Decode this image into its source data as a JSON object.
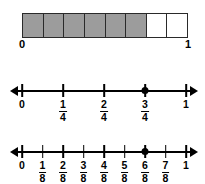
{
  "figure": {
    "bar_model": {
      "name": "fraction-bar-eighths",
      "total_cells": 8,
      "shaded_cells": 6,
      "shade_color": "#9c9c9c",
      "unshaded_color": "#ffffff",
      "border_color": "#2a2a2a",
      "cells": [
        {
          "index": 1,
          "state": "shaded"
        },
        {
          "index": 2,
          "state": "shaded"
        },
        {
          "index": 3,
          "state": "shaded"
        },
        {
          "index": 4,
          "state": "shaded"
        },
        {
          "index": 5,
          "state": "shaded"
        },
        {
          "index": 6,
          "state": "shaded"
        },
        {
          "index": 7,
          "state": "unshaded"
        },
        {
          "index": 8,
          "state": "unshaded"
        }
      ],
      "start_label": "0",
      "end_label": "1"
    },
    "number_lines": [
      {
        "name": "number-line-fourths",
        "denominator": 4,
        "axis_min": 0,
        "axis_max": 1,
        "arrows": [
          "left",
          "right"
        ],
        "marked_point": {
          "label_numerator": "3",
          "label_denominator": "4",
          "position": 0.75
        },
        "ticks": [
          {
            "position": 0,
            "type": "whole",
            "whole": "0"
          },
          {
            "position": 0.25,
            "type": "fraction",
            "numerator": "1",
            "denominator": "4"
          },
          {
            "position": 0.5,
            "type": "fraction",
            "numerator": "2",
            "denominator": "4"
          },
          {
            "position": 0.75,
            "type": "fraction",
            "numerator": "3",
            "denominator": "4"
          },
          {
            "position": 1,
            "type": "whole",
            "whole": "1"
          }
        ]
      },
      {
        "name": "number-line-eighths",
        "denominator": 8,
        "axis_min": 0,
        "axis_max": 1,
        "arrows": [
          "left",
          "right"
        ],
        "marked_point": {
          "label_numerator": "6",
          "label_denominator": "8",
          "position": 0.75
        },
        "ticks": [
          {
            "position": 0,
            "type": "whole",
            "whole": "0"
          },
          {
            "position": 0.125,
            "type": "fraction",
            "numerator": "1",
            "denominator": "8"
          },
          {
            "position": 0.25,
            "type": "fraction",
            "numerator": "2",
            "denominator": "8"
          },
          {
            "position": 0.375,
            "type": "fraction",
            "numerator": "3",
            "denominator": "8"
          },
          {
            "position": 0.5,
            "type": "fraction",
            "numerator": "4",
            "denominator": "8"
          },
          {
            "position": 0.625,
            "type": "fraction",
            "numerator": "5",
            "denominator": "8"
          },
          {
            "position": 0.75,
            "type": "fraction",
            "numerator": "6",
            "denominator": "8"
          },
          {
            "position": 0.875,
            "type": "fraction",
            "numerator": "7",
            "denominator": "8"
          },
          {
            "position": 1,
            "type": "whole",
            "whole": "1"
          }
        ]
      }
    ]
  }
}
